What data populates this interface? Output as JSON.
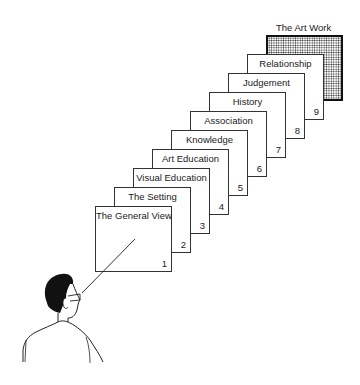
{
  "diagram": {
    "target": {
      "label": "The Art Work"
    },
    "frames": [
      {
        "number": "1",
        "label": "The General View"
      },
      {
        "number": "2",
        "label": "The Setting"
      },
      {
        "number": "3",
        "label": "Visual Education"
      },
      {
        "number": "4",
        "label": "Art Education"
      },
      {
        "number": "5",
        "label": "Knowledge"
      },
      {
        "number": "6",
        "label": "Association"
      },
      {
        "number": "7",
        "label": "History"
      },
      {
        "number": "8",
        "label": "Judgement"
      },
      {
        "number": "9",
        "label": "Relationship"
      }
    ],
    "viewer": {
      "icon": "viewer-figure-icon"
    },
    "colors": {
      "line": "#333333",
      "hair": "#111111",
      "dots": "#333333"
    }
  }
}
